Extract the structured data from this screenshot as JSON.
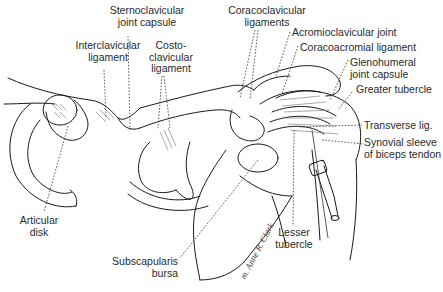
{
  "figure": {
    "labels": {
      "sternoclavicular_joint_capsule": "Sternoclavicular\njoint capsule",
      "interclavicular_ligament": "Interclavicular\nligament",
      "costoclavicular_ligament": "Costo-\nclavicular\nligament",
      "coracoclavicular_ligaments": "Coracoclavicular\nligaments",
      "acromioclavicular_joint": "Acromioclavicular joint",
      "coracoacromial_ligament": "Coracoacromial ligament",
      "glenohumeral_joint_capsule": "Glenohumeral\njoint capsule",
      "greater_tubercle": "Greater tubercle",
      "transverse_lig": "Transverse lig.",
      "synovial_sleeve": "Synovial sleeve\nof biceps tendon",
      "articular_disk": "Articular\ndisk",
      "subscapularis_bursa": "Subscapularis\nbursa",
      "lesser_tubercle": "Lesser\ntubercle"
    },
    "signature": "m. Anne R. Clark",
    "colors": {
      "line": "#1a1a1a",
      "leader": "#333333",
      "text": "#2a2a2a",
      "background": "#ffffff"
    }
  }
}
